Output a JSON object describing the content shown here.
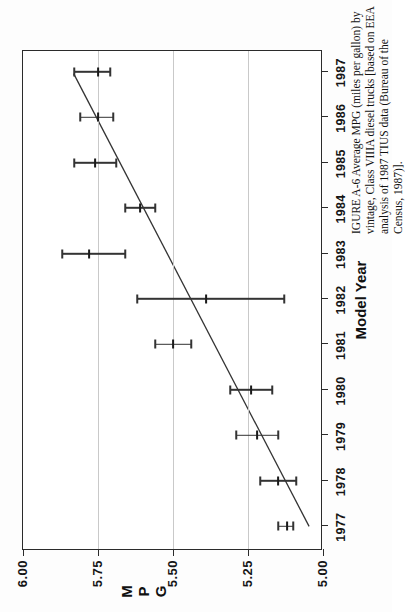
{
  "figure": {
    "caption_line1": "IGURE A-6  Average MPG (miles per gallon) by vintage, Class VIIIA diesel trucks [based on EEA",
    "caption_line2": "analysis of 1987 TIUS data (Bureau of the Census, 1987)].",
    "caption_figure_number": "IGURE A-6",
    "caption_rest": "Average MPG (miles per gallon) by vintage, Class VIIIA diesel trucks [based on EEA analysis of 1987 TIUS data (Bureau of the Census, 1987)]."
  },
  "axis": {
    "x_title": "Model Year",
    "y_title_chars": [
      "M",
      "P",
      "G"
    ],
    "y_title": "MPG"
  },
  "chart_data": {
    "type": "scatter",
    "title": "",
    "subtitle": "",
    "xlabel": "Model Year",
    "ylabel": "MPG",
    "x": [
      1977,
      1978,
      1979,
      1980,
      1981,
      1982,
      1983,
      1984,
      1985,
      1986,
      1987
    ],
    "categories": [
      "1977",
      "1978",
      "1979",
      "1980",
      "1981",
      "1982",
      "1983",
      "1984",
      "1985",
      "1986",
      "1987"
    ],
    "values": [
      5.12,
      5.15,
      5.22,
      5.24,
      5.5,
      5.39,
      5.78,
      5.61,
      5.76,
      5.75,
      5.75
    ],
    "error_low": [
      5.1,
      5.09,
      5.15,
      5.17,
      5.44,
      5.13,
      5.66,
      5.56,
      5.69,
      5.7,
      5.71
    ],
    "error_high": [
      5.15,
      5.21,
      5.29,
      5.31,
      5.56,
      5.62,
      5.87,
      5.66,
      5.83,
      5.81,
      5.83
    ],
    "xlim": [
      1976.5,
      1987.5
    ],
    "ylim": [
      5.0,
      6.0
    ],
    "yticks": [
      5.0,
      5.25,
      5.5,
      5.75,
      6.0
    ],
    "ytick_labels": [
      "5.00",
      "5.25",
      "5.50",
      "5.75",
      "6.00"
    ],
    "xticks": [
      1977,
      1978,
      1979,
      1980,
      1981,
      1982,
      1983,
      1984,
      1985,
      1986,
      1987
    ],
    "xtick_labels": [
      "1977",
      "1978",
      "1979",
      "1980",
      "1981",
      "1982",
      "1983",
      "1984",
      "1985",
      "1986",
      "1987"
    ],
    "grid": "horizontal-on-value-axis",
    "legend": "none",
    "series": [
      {
        "name": "Average MPG with error bars",
        "values": [
          5.12,
          5.15,
          5.22,
          5.24,
          5.5,
          5.39,
          5.78,
          5.61,
          5.76,
          5.75,
          5.75
        ]
      },
      {
        "name": "Fitted trend line",
        "type": "line",
        "endpoints": [
          {
            "x": 1977,
            "y": 5.04
          },
          {
            "x": 1987,
            "y": 5.83
          }
        ]
      }
    ],
    "colors": {
      "axis": "#2b2b2b",
      "grid": "#c9c9c9",
      "marker": "#1a1a1a",
      "trend": "#333333",
      "background": "#ffffff"
    }
  }
}
